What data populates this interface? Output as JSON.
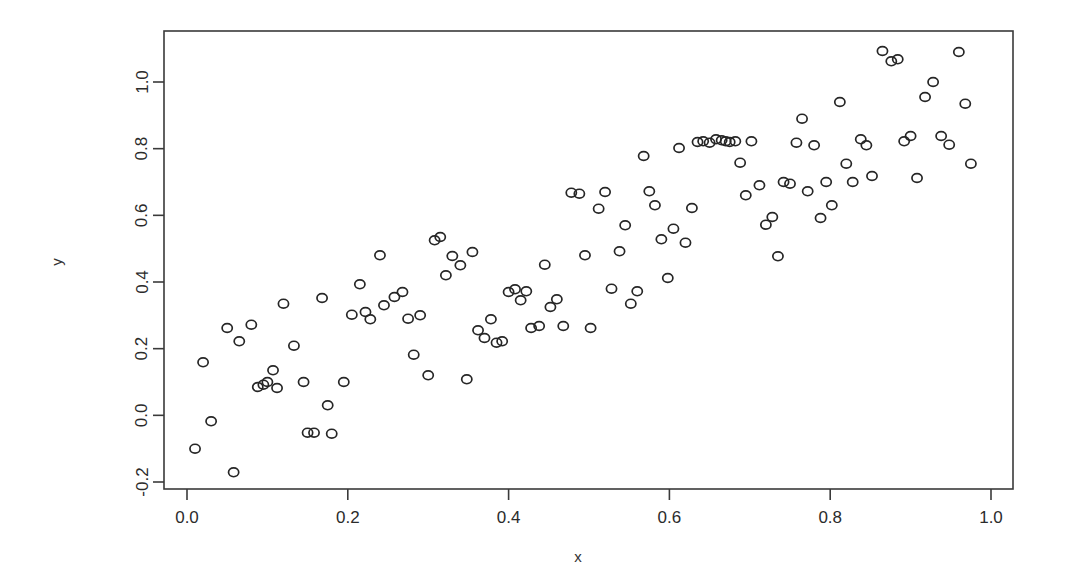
{
  "chart_data": {
    "type": "scatter",
    "title": "",
    "subtitle": "",
    "xlabel": "x",
    "ylabel": "y",
    "xlim": [
      -0.035,
      1.035
    ],
    "ylim": [
      -0.225,
      1.145
    ],
    "xticks": [
      0.0,
      0.2,
      0.4,
      0.6,
      0.8,
      1.0
    ],
    "xticklabels": [
      "0.0",
      "0.2",
      "0.4",
      "0.6",
      "0.8",
      "1.0"
    ],
    "yticks": [
      -0.2,
      0.0,
      0.2,
      0.4,
      0.6,
      0.8,
      1.0
    ],
    "yticklabels": [
      "-0.2",
      "0.0",
      "0.2",
      "0.4",
      "0.6",
      "0.8",
      "1.0"
    ],
    "grid": false,
    "legend": null,
    "marker": "open-circle",
    "marker_color": "#262626",
    "marker_size": 7,
    "n_points": 118,
    "x": [
      0.01,
      0.02,
      0.03,
      0.05,
      0.058,
      0.065,
      0.08,
      0.088,
      0.095,
      0.1,
      0.107,
      0.112,
      0.12,
      0.133,
      0.145,
      0.15,
      0.158,
      0.168,
      0.175,
      0.18,
      0.195,
      0.205,
      0.215,
      0.222,
      0.228,
      0.24,
      0.245,
      0.258,
      0.268,
      0.275,
      0.282,
      0.29,
      0.3,
      0.308,
      0.315,
      0.322,
      0.33,
      0.34,
      0.348,
      0.355,
      0.362,
      0.37,
      0.378,
      0.385,
      0.392,
      0.4,
      0.408,
      0.415,
      0.422,
      0.428,
      0.438,
      0.445,
      0.452,
      0.46,
      0.468,
      0.478,
      0.488,
      0.495,
      0.502,
      0.512,
      0.52,
      0.528,
      0.538,
      0.545,
      0.552,
      0.56,
      0.568,
      0.575,
      0.582,
      0.59,
      0.598,
      0.605,
      0.612,
      0.62,
      0.628,
      0.635,
      0.642,
      0.65,
      0.658,
      0.665,
      0.67,
      0.675,
      0.682,
      0.688,
      0.695,
      0.702,
      0.712,
      0.72,
      0.728,
      0.735,
      0.742,
      0.75,
      0.758,
      0.765,
      0.772,
      0.78,
      0.788,
      0.795,
      0.802,
      0.812,
      0.82,
      0.828,
      0.838,
      0.845,
      0.852,
      0.865,
      0.876,
      0.884,
      0.892,
      0.9,
      0.908,
      0.918,
      0.928,
      0.938,
      0.948,
      0.96,
      0.968,
      0.975
    ],
    "y": [
      -0.1,
      0.159,
      -0.018,
      0.262,
      -0.171,
      0.222,
      0.272,
      0.085,
      0.092,
      0.1,
      0.135,
      0.082,
      0.335,
      0.209,
      0.1,
      -0.052,
      -0.052,
      0.352,
      0.03,
      -0.055,
      0.1,
      0.302,
      0.393,
      0.31,
      0.288,
      0.48,
      0.33,
      0.355,
      0.37,
      0.29,
      0.182,
      0.3,
      0.12,
      0.525,
      0.535,
      0.42,
      0.478,
      0.45,
      0.108,
      0.49,
      0.255,
      0.232,
      0.288,
      0.218,
      0.222,
      0.37,
      0.378,
      0.345,
      0.372,
      0.262,
      0.268,
      0.452,
      0.325,
      0.348,
      0.268,
      0.668,
      0.665,
      0.48,
      0.262,
      0.62,
      0.67,
      0.38,
      0.492,
      0.57,
      0.335,
      0.372,
      0.778,
      0.672,
      0.63,
      0.528,
      0.412,
      0.56,
      0.802,
      0.518,
      0.622,
      0.82,
      0.822,
      0.818,
      0.828,
      0.825,
      0.822,
      0.82,
      0.822,
      0.758,
      0.66,
      0.822,
      0.69,
      0.572,
      0.595,
      0.477,
      0.7,
      0.695,
      0.818,
      0.89,
      0.672,
      0.81,
      0.592,
      0.7,
      0.63,
      0.94,
      0.755,
      0.7,
      0.828,
      0.81,
      0.718,
      1.093,
      1.062,
      1.068,
      0.822,
      0.838,
      0.712,
      0.955,
      1.0,
      0.838,
      0.812,
      1.09,
      0.935,
      0.755
    ]
  },
  "axes": {
    "x_title": "x",
    "y_title": "y"
  }
}
